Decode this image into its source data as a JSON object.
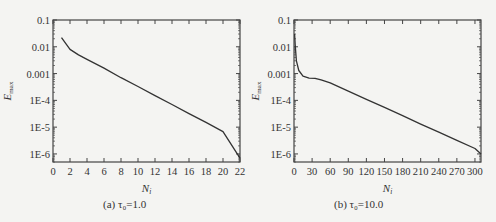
{
  "chart_data": [
    {
      "type": "line",
      "panel": "a",
      "caption": "(a) τ₀=1.0",
      "xlabel": "N_i",
      "ylabel": "E_max",
      "yscale": "log",
      "xlim": [
        0,
        22
      ],
      "ylim": [
        5e-07,
        0.1
      ],
      "xticks": [
        0,
        2,
        4,
        6,
        8,
        10,
        12,
        14,
        16,
        18,
        20,
        22
      ],
      "yticks": [
        "0.1",
        "0.01",
        "0.001",
        "1E-4",
        "1E-5",
        "1E-6"
      ],
      "grid": false,
      "x": [
        1,
        2,
        3,
        4,
        6,
        8,
        10,
        12,
        14,
        16,
        18,
        20,
        22
      ],
      "y": [
        0.022,
        0.008,
        0.005,
        0.0034,
        0.0016,
        0.0007,
        0.00033,
        0.00015,
        7e-05,
        3.2e-05,
        1.5e-05,
        6.8e-06,
        7e-07
      ]
    },
    {
      "type": "line",
      "panel": "b",
      "caption": "(b) τ₀=10.0",
      "xlabel": "N_i",
      "ylabel": "E_max",
      "yscale": "log",
      "xlim": [
        0,
        310
      ],
      "ylim": [
        5e-07,
        0.1
      ],
      "xticks": [
        0,
        30,
        60,
        90,
        120,
        150,
        180,
        210,
        240,
        270,
        300
      ],
      "yticks": [
        "0.1",
        "0.01",
        "0.001",
        "1E-4",
        "1E-5",
        "1E-6"
      ],
      "grid": false,
      "x": [
        1,
        2,
        4,
        8,
        15,
        25,
        35,
        45,
        60,
        90,
        120,
        150,
        180,
        210,
        240,
        270,
        300,
        310
      ],
      "y": [
        0.03,
        0.012,
        0.003,
        0.0013,
        0.0008,
        0.00068,
        0.00066,
        0.00058,
        0.00045,
        0.00022,
        0.00011,
        5.5e-05,
        2.7e-05,
        1.3e-05,
        6.5e-06,
        3.2e-06,
        1.6e-06,
        1e-06
      ]
    }
  ],
  "labels": {
    "a": {
      "xlabel_main": "N",
      "xlabel_sub": "i",
      "ylabel_main": "E",
      "ylabel_sub": "max",
      "caption": "(a) τ₀=1.0",
      "yticks": [
        "0.1",
        "0.01",
        "0.001",
        "1E-4",
        "1E-5",
        "1E-6"
      ],
      "xticks": [
        "0",
        "2",
        "4",
        "6",
        "8",
        "10",
        "12",
        "14",
        "16",
        "18",
        "20",
        "22"
      ]
    },
    "b": {
      "xlabel_main": "N",
      "xlabel_sub": "i",
      "ylabel_main": "E",
      "ylabel_sub": "max",
      "caption": "(b) τ₀=10.0",
      "yticks": [
        "0.1",
        "0.01",
        "0.001",
        "1E-4",
        "1E-5",
        "1E-6"
      ],
      "xticks": [
        "0",
        "30",
        "60",
        "90",
        "120",
        "150",
        "180",
        "210",
        "240",
        "270",
        "300"
      ]
    }
  },
  "colors": {
    "line": "#333333",
    "frame": "#444444",
    "background": "#f4f4f2"
  }
}
